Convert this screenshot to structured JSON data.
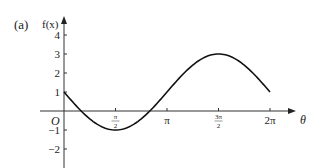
{
  "panel_label": "(a)",
  "chart_data": {
    "type": "line",
    "title": "",
    "function": "f(x) = 1 - 2 sin x",
    "xlabel": "θ",
    "ylabel": "f(x)",
    "x_ticks": [
      {
        "value": 1.5708,
        "label_num": "π",
        "label_den": "2"
      },
      {
        "value": 3.1416,
        "label": "π"
      },
      {
        "value": 4.7124,
        "label_num": "3π",
        "label_den": "2"
      },
      {
        "value": 6.2832,
        "label": "2π"
      }
    ],
    "y_ticks": [
      4,
      3,
      2,
      1,
      -1,
      -2
    ],
    "origin_label": "O",
    "xlim": [
      0,
      6.2832
    ],
    "ylim": [
      -2,
      4
    ],
    "grid": false,
    "x": [
      0,
      0.5236,
      1.5708,
      2.618,
      3.1416,
      4.7124,
      6.2832
    ],
    "y": [
      1,
      0,
      -1,
      0,
      1,
      3,
      1
    ]
  },
  "axes_color": "#222222",
  "curve_color": "#111111"
}
